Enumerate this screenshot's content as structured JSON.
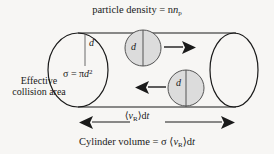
{
  "figure": {
    "kind": "physics-diagram",
    "background_color": "#f7f6f4",
    "line_color": "#1a1a1a",
    "sphere_fill_color": "#dcdcdc"
  },
  "labels": {
    "title": "particle density = n",
    "title_sub": "p",
    "effective_line1": "Effective",
    "effective_line2": "collision area",
    "sigma_prefix": "σ = π",
    "sigma_var": "d",
    "sigma_exp": "2",
    "diameter_left": "d",
    "diameter_middle": "d",
    "diameter_right": "d",
    "length_open": "⟨",
    "length_var": "v",
    "length_sub": "R",
    "length_close": "⟩d",
    "length_t": "t",
    "caption_prefix": "Cylinder volume = σ ⟨",
    "caption_var": "v",
    "caption_sub": "R",
    "caption_close": "⟩d",
    "caption_t": "t"
  },
  "geometry": {
    "cylinder_top_y": 33,
    "cylinder_bottom_y": 107,
    "cylinder_left_x": 78,
    "cylinder_right_x": 234,
    "left_ellipse": {
      "cx": 78,
      "cy": 70,
      "rx": 30,
      "ry": 37
    },
    "right_ellipse": {
      "cx": 234,
      "cy": 70,
      "rx": 24,
      "ry": 37
    },
    "spheres": [
      {
        "cx": 143,
        "cy": 48,
        "r": 18,
        "arrow": "right"
      },
      {
        "cx": 186,
        "cy": 88,
        "r": 18,
        "arrow": "left"
      }
    ],
    "dimension_arrow": {
      "y": 122,
      "x1": 82,
      "x2": 232
    }
  }
}
